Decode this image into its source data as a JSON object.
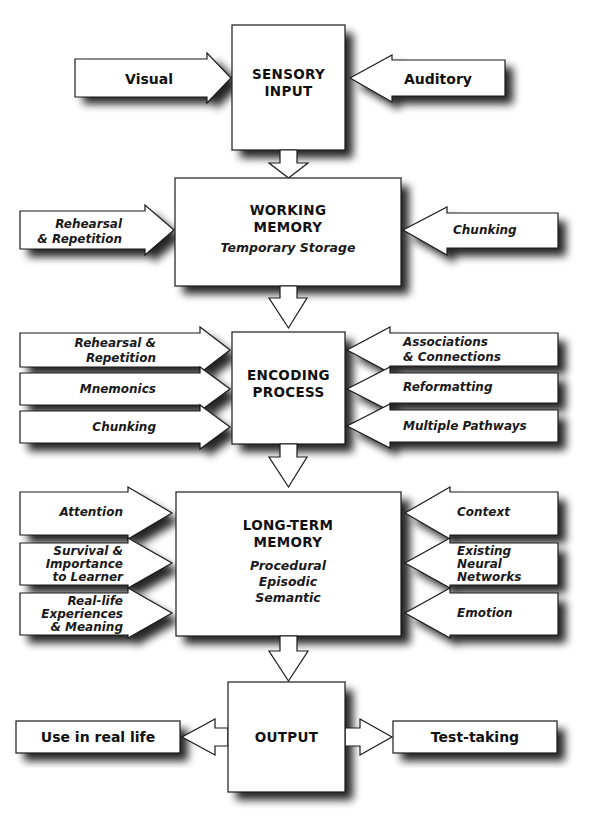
{
  "stages": {
    "sensory": {
      "title_lines": [
        "SENSORY",
        "INPUT"
      ]
    },
    "working": {
      "title_lines": [
        "WORKING",
        "MEMORY"
      ],
      "subtitle": "Temporary Storage"
    },
    "encoding": {
      "title_lines": [
        "ENCODING",
        "PROCESS"
      ]
    },
    "longterm": {
      "title_lines": [
        "LONG-TERM",
        "MEMORY"
      ],
      "types": [
        "Procedural",
        "Episodic",
        "Semantic"
      ]
    },
    "output": {
      "title": "OUTPUT"
    }
  },
  "inputs": {
    "sensory_left": {
      "label": "Visual"
    },
    "sensory_right": {
      "label": "Auditory"
    },
    "working_left": {
      "lines": [
        "Rehearsal",
        "& Repetition"
      ]
    },
    "working_right": {
      "lines": [
        "Chunking"
      ]
    },
    "encoding_left": [
      {
        "lines": [
          "Rehearsal &",
          "Repetition"
        ]
      },
      {
        "lines": [
          "Mnemonics"
        ]
      },
      {
        "lines": [
          "Chunking"
        ]
      }
    ],
    "encoding_right": [
      {
        "lines": [
          "Associations",
          "& Connections"
        ]
      },
      {
        "lines": [
          "Reformatting"
        ]
      },
      {
        "lines": [
          "Multiple Pathways"
        ]
      }
    ],
    "longterm_left": [
      {
        "lines": [
          "Attention"
        ]
      },
      {
        "lines": [
          "Survival &",
          "Importance",
          "to Learner"
        ]
      },
      {
        "lines": [
          "Real-life",
          "Experiences",
          "& Meaning"
        ]
      }
    ],
    "longterm_right": [
      {
        "lines": [
          "Context"
        ]
      },
      {
        "lines": [
          "Existing",
          "Neural",
          "Networks"
        ]
      },
      {
        "lines": [
          "Emotion"
        ]
      }
    ]
  },
  "outputs": {
    "left": {
      "label": "Use in real life"
    },
    "right": {
      "label": "Test-taking"
    }
  },
  "colors": {
    "fill": "#ffffff",
    "stroke": "#1a1a1a",
    "shadow": "#000000",
    "text": "#111111"
  }
}
